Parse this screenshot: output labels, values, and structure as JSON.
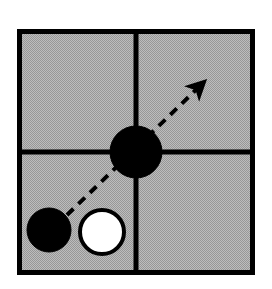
{
  "figure": {
    "canvas": {
      "width": 272,
      "height": 289
    },
    "background_color": "#ffffff",
    "board": {
      "name": "board-frame",
      "x": 17,
      "y": 29,
      "width": 238,
      "height": 246,
      "fill_color": "#ababab",
      "fill_pattern": "dither-checkerboard",
      "pattern_light": "#c6c6c6",
      "pattern_dark": "#909090",
      "border_color": "#000000",
      "border_width": 5
    },
    "grid": {
      "name": "grid-lines",
      "line_color": "#000000",
      "line_width": 5,
      "vertical_x": 136,
      "horizontal_y": 152,
      "cells": 4
    },
    "stones": [
      {
        "id": "stone-center-black",
        "label": "black stone at intersection",
        "color": "black",
        "fill": "#000000",
        "stroke": "#000000",
        "cx": 136,
        "cy": 152,
        "r": 26
      },
      {
        "id": "stone-lower-left-black",
        "label": "black stone lower left",
        "color": "black",
        "fill": "#000000",
        "stroke": "#000000",
        "cx": 49,
        "cy": 230,
        "r": 22
      },
      {
        "id": "stone-lower-left-white",
        "label": "white stone lower left",
        "color": "white",
        "fill": "#ffffff",
        "stroke": "#000000",
        "cx": 102,
        "cy": 232,
        "r": 22
      }
    ],
    "arrow": {
      "name": "motion-arrow",
      "style": "dashed",
      "color": "#000000",
      "line_width": 4,
      "dash_length": 9,
      "dash_gap": 7,
      "start_x": 67,
      "start_y": 215,
      "end_x": 203,
      "end_y": 83,
      "head_length": 18,
      "head_width": 13
    }
  }
}
